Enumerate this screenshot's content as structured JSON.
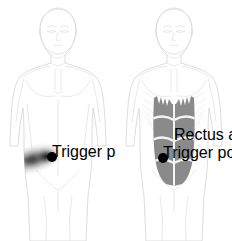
{
  "chart": {
    "title": "Rectus Abdominis Trigger Point Referred Pain Pattern",
    "type": "anatomical-diagram",
    "canvas": {
      "width": 232,
      "height": 241,
      "background": "#ffffff"
    },
    "figure_count": 2,
    "view": "anterior"
  },
  "colors": {
    "body_outline": "#d8d8d8",
    "body_detail": "#e2e2e2",
    "body_fill": "#ffffff",
    "muscle_fill": "#8a8a8a",
    "muscle_fill_light": "#9a9a9a",
    "muscle_divider": "#f2f2f2",
    "rib_line": "#e6e6e6",
    "trigger_point": "#000000",
    "pain_core": "#1a1a1a",
    "pain_mid": "#6e6e6e",
    "pain_edge": "#d5d5d5",
    "background": "#ffffff"
  },
  "panels": [
    {
      "id": "pain-pattern",
      "label": "Referred pain pattern",
      "position": "left",
      "x": 0,
      "width": 116,
      "shows_muscle": false,
      "shows_pain_spread": true
    },
    {
      "id": "muscle-anatomy",
      "label": "Rectus abdominis muscle",
      "position": "right",
      "x": 116,
      "width": 116,
      "shows_muscle": true,
      "shows_pain_spread": false
    }
  ],
  "trigger_points": [
    {
      "id": "tp-left-figure",
      "label": "Trigger point",
      "panel": "pain-pattern",
      "cx": 52,
      "cy": 157,
      "r": 5.0,
      "side": "left-of-midline",
      "region": "lower abdomen"
    },
    {
      "id": "tp-right-figure",
      "label": "Trigger point",
      "panel": "muscle-anatomy",
      "cx": 47,
      "cy": 158,
      "r": 5.0,
      "side": "left-of-midline",
      "region": "lower rectus abdominis"
    }
  ],
  "pain_spread": {
    "id": "referred-pain-plume",
    "label": "Referred pain area",
    "description": "Diffuse horizontal band spreading laterally and superiorly from the trigger point",
    "origin_cx": 52,
    "origin_cy": 157,
    "extent_x_min": 18,
    "extent_x_max": 62,
    "extent_y_min": 128,
    "extent_y_max": 186,
    "intensity_gradient": [
      "dense",
      "moderate",
      "faint"
    ],
    "rotation_deg": -18
  },
  "muscle": {
    "id": "rectus-abdominis",
    "name": "Rectus abdominis",
    "fill": "#8a8a8a",
    "top_y": 96,
    "bottom_y": 185,
    "left_x": 34,
    "right_x": 76,
    "has_linea_alba": true,
    "tendinous_intersections": 3,
    "digitations_at_top": 4
  },
  "body_features": {
    "head": "oval cranium with face",
    "face_elements": [
      "eyebrows",
      "eyes",
      "nose",
      "mouth-line"
    ],
    "neck": "with sternal notch",
    "clavicles": 2,
    "sternum": "visible",
    "pectorals": 2,
    "ribcage_lines": 8,
    "arms": "hanging at sides",
    "legs": "upper thigh visible",
    "groin": "inguinal crease"
  },
  "accessibility": {
    "alt_text": "Two anterior-view male torso diagrams. Left figure shows a diffuse dark referred pain plume in the left lower abdomen with a black trigger point marker. Right figure shows the shaded rectus abdominis muscle with tendinous intersections and the corresponding trigger point marker."
  }
}
